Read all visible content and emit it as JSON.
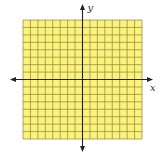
{
  "diagram": {
    "type": "coordinate-grid",
    "grid": {
      "columns": 16,
      "rows": 16,
      "fill_color": "#fbf27a",
      "line_color": "#8a8440",
      "left": 23,
      "top": 20,
      "width": 119,
      "height": 119
    },
    "axes": {
      "color": "#222222",
      "x_axis_label": "x",
      "y_axis_label": "y",
      "origin_col": 8,
      "origin_row": 8
    }
  }
}
